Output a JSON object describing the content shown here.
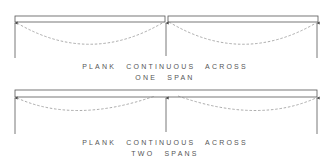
{
  "diagrams": [
    {
      "id": "one-span",
      "caption_line1": "PLANK CONTINUOUS ACROSS",
      "caption_line2": "ONE SPAN",
      "planks": [
        [
          15,
          165
        ],
        [
          168,
          318
        ]
      ],
      "supports_x": [
        15,
        166,
        317
      ]
    },
    {
      "id": "two-spans",
      "caption_line1": "PLANK CONTINUOUS ACROSS",
      "caption_line2": "TWO SPANS",
      "planks": [
        [
          15,
          317
        ]
      ],
      "supports_x": [
        15,
        166,
        317
      ]
    }
  ],
  "colors": {
    "line": "#555555",
    "dashed": "#888888",
    "text": "#555555"
  }
}
